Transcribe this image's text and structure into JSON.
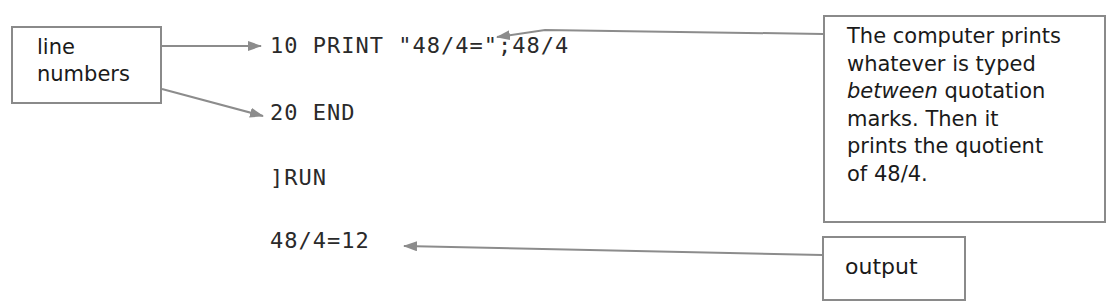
{
  "callouts": {
    "line_numbers": {
      "line1": "line",
      "line2": "numbers"
    },
    "note": {
      "line1": "The computer prints",
      "line2": "whatever is typed",
      "line3_em": "between",
      "line3_rest": " quotation",
      "line4": "marks. Then it",
      "line5": "prints the quotient",
      "line6": "of 48/4."
    },
    "output": {
      "label": "output"
    }
  },
  "program": {
    "lines": [
      "10 PRINT \"48/4=\";48/4",
      "20 END",
      "]RUN",
      "48/4=12"
    ]
  },
  "colors": {
    "arrow": "#8c8c8c",
    "border": "#8a8a8a",
    "text": "#1a1a1a"
  }
}
